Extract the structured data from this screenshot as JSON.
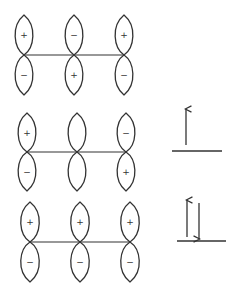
{
  "diagram": {
    "colors": {
      "stroke": "#333333",
      "background": "#ffffff"
    },
    "rows": [
      {
        "name": "psi3-antibonding",
        "y_node": 55,
        "lobe_half_height": 20,
        "lobe_half_width": 11.5,
        "line": {
          "x1": 24,
          "x2": 124
        },
        "orbitals": [
          {
            "cx": 24,
            "top": "+",
            "bottom": "−"
          },
          {
            "cx": 74,
            "top": "−",
            "bottom": "+"
          },
          {
            "cx": 124,
            "top": "+",
            "bottom": "−"
          }
        ],
        "level": null
      },
      {
        "name": "psi2-nonbonding",
        "y_node": 152,
        "lobe_half_height": 19.5,
        "lobe_half_width": 11.5,
        "line": {
          "x1": 27,
          "x2": 126
        },
        "orbitals": [
          {
            "cx": 27,
            "top": "+",
            "bottom": "−"
          },
          {
            "cx": 77,
            "top": "",
            "bottom": ""
          },
          {
            "cx": 126,
            "top": "−",
            "bottom": "+"
          }
        ],
        "level": {
          "x1": 172,
          "x2": 222,
          "y": 151,
          "electrons": [
            {
              "direction": "up",
              "x": 186,
              "y_top": 109,
              "y_bottom": 145
            }
          ],
          "occupancy_label": "1 electron (spin up)"
        }
      },
      {
        "name": "psi1-bonding",
        "y_node": 242,
        "lobe_half_height": 20,
        "lobe_half_width": 12,
        "line": {
          "x1": 30,
          "x2": 130
        },
        "orbitals": [
          {
            "cx": 30,
            "top": "+",
            "bottom": "−"
          },
          {
            "cx": 80,
            "top": "+",
            "bottom": "−"
          },
          {
            "cx": 130,
            "top": "+",
            "bottom": "−"
          }
        ],
        "level": {
          "x1": 177,
          "x2": 226,
          "y": 241,
          "electrons": [
            {
              "direction": "up",
              "x": 187,
              "y_top": 200,
              "y_bottom": 237
            },
            {
              "direction": "down",
              "x": 199,
              "y_top": 203,
              "y_bottom": 239
            }
          ],
          "occupancy_label": "2 electrons (paired)"
        }
      }
    ]
  }
}
